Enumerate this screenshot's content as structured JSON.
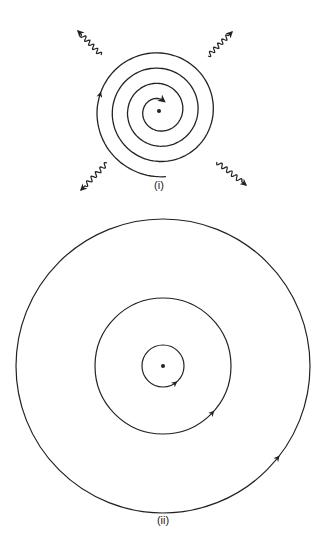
{
  "colors": {
    "background": "#ffffff",
    "stroke": "#222222"
  },
  "diagrams": [
    {
      "id": "i",
      "label": "(i)",
      "description": "Classical electron spiralling into the nucleus while radiating electromagnetic waves",
      "nucleus": {
        "cx": 159,
        "cy": 111,
        "r": 2
      },
      "spiral": {
        "direction": "counterclockwise-inward",
        "turns": 3.6,
        "inner_radius": 11,
        "outer_radius": 66,
        "start_angle_deg": -60
      },
      "radiation_arrows": [
        {
          "name": "radiation-arrow-upper-left",
          "from": [
            101,
            55
          ],
          "to": [
            78,
            31
          ]
        },
        {
          "name": "radiation-arrow-upper-right",
          "from": [
            208,
            56
          ],
          "to": [
            232,
            32
          ]
        },
        {
          "name": "radiation-arrow-lower-left",
          "from": [
            107,
            163
          ],
          "to": [
            81,
            190
          ]
        },
        {
          "name": "radiation-arrow-lower-right",
          "from": [
            217,
            162
          ],
          "to": [
            246,
            185
          ]
        }
      ],
      "label_pos": [
        159,
        186
      ]
    },
    {
      "id": "ii",
      "label": "(ii)",
      "description": "Stable circular orbits (Bohr model) around the nucleus",
      "nucleus": {
        "cx": 163,
        "cy": 366,
        "r": 2
      },
      "orbits": [
        {
          "name": "orbit-inner",
          "r": 21,
          "arrow_angle_deg": 50
        },
        {
          "name": "orbit-middle",
          "r": 68,
          "arrow_angle_deg": 42
        },
        {
          "name": "orbit-outer",
          "r": 147,
          "arrow_angle_deg": 38
        }
      ],
      "label_pos": [
        163,
        521
      ]
    }
  ]
}
